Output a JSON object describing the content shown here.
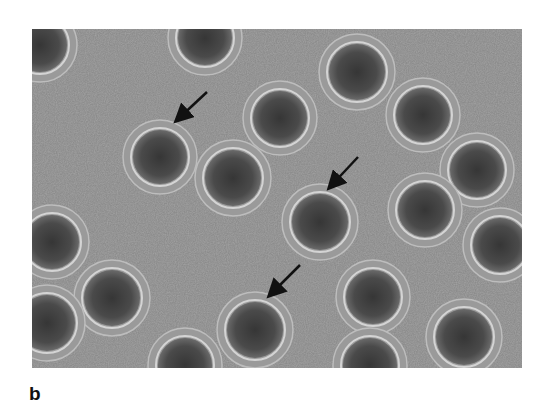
{
  "figure": {
    "panel_label": "b",
    "background_color": "#8e8e8e",
    "cell_core_color": "#3e3e3e",
    "halo_color": "#d4d4d4",
    "arrow_color": "#111111",
    "cells": [
      {
        "cx": 8,
        "cy": 16,
        "r": 27
      },
      {
        "cx": 173,
        "cy": 9,
        "r": 27
      },
      {
        "cx": 325,
        "cy": 43,
        "r": 28
      },
      {
        "cx": 391,
        "cy": 86,
        "r": 27
      },
      {
        "cx": 248,
        "cy": 89,
        "r": 27
      },
      {
        "cx": 128,
        "cy": 128,
        "r": 27
      },
      {
        "cx": 201,
        "cy": 149,
        "r": 28
      },
      {
        "cx": 445,
        "cy": 141,
        "r": 27
      },
      {
        "cx": 393,
        "cy": 181,
        "r": 27
      },
      {
        "cx": 288,
        "cy": 193,
        "r": 28
      },
      {
        "cx": 468,
        "cy": 216,
        "r": 27
      },
      {
        "cx": 20,
        "cy": 213,
        "r": 27
      },
      {
        "cx": 80,
        "cy": 269,
        "r": 28
      },
      {
        "cx": 341,
        "cy": 268,
        "r": 27
      },
      {
        "cx": 15,
        "cy": 294,
        "r": 28
      },
      {
        "cx": 223,
        "cy": 301,
        "r": 28
      },
      {
        "cx": 432,
        "cy": 308,
        "r": 28
      },
      {
        "cx": 153,
        "cy": 336,
        "r": 27
      },
      {
        "cx": 338,
        "cy": 336,
        "r": 27
      }
    ],
    "arrows": [
      {
        "x1": 175,
        "y1": 63,
        "x2": 145,
        "y2": 91
      },
      {
        "x1": 326,
        "y1": 128,
        "x2": 298,
        "y2": 158
      },
      {
        "x1": 268,
        "y1": 236,
        "x2": 238,
        "y2": 266
      }
    ]
  }
}
